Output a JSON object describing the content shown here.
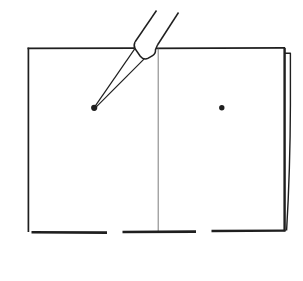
{
  "figure": {
    "colors": {
      "paper": "#ffffff",
      "ink": "#1f1f1f",
      "light_ink": "#6e6e6e"
    },
    "canvas": {
      "width": 303,
      "height": 281
    },
    "elements": [
      {
        "name": "sheet-top-edge-left",
        "type": "line",
        "x1": 27.5,
        "y1": 48.3,
        "x2": 134,
        "y2": 48.1,
        "w": 1.7
      },
      {
        "name": "sheet-top-edge-right",
        "type": "line",
        "x1": 150,
        "y1": 48.3,
        "x2": 285,
        "y2": 47.8,
        "w": 1.7
      },
      {
        "name": "sheet-left-edge",
        "type": "line",
        "x1": 28.4,
        "y1": 47.6,
        "x2": 28.4,
        "y2": 232,
        "w": 1.7
      },
      {
        "name": "sheet-right-edge",
        "type": "line",
        "x1": 284.6,
        "y1": 47.8,
        "x2": 284.6,
        "y2": 231.2,
        "w": 2.4
      },
      {
        "name": "back-sheet-edge",
        "type": "path",
        "d": "M284.5 53.3 L290.4 53.3 L290.4 105 Q290.2 170 286.6 230.5",
        "w": 1.4
      },
      {
        "name": "center-fold-line",
        "type": "line",
        "x1": 158.2,
        "y1": 48.5,
        "x2": 158.2,
        "y2": 231.5,
        "w": 0.9,
        "color": "light"
      },
      {
        "name": "bottom-edge-dash-left",
        "type": "line",
        "x1": 31.5,
        "y1": 232.3,
        "x2": 107,
        "y2": 232.6,
        "w": 2.6
      },
      {
        "name": "bottom-edge-dash-middle",
        "type": "line",
        "x1": 122.5,
        "y1": 232,
        "x2": 196,
        "y2": 231.6,
        "w": 2.6
      },
      {
        "name": "bottom-edge-dash-right",
        "type": "line",
        "x1": 211.5,
        "y1": 231,
        "x2": 285.5,
        "y2": 230.6,
        "w": 2.4
      },
      {
        "name": "stylus-barrel-left-edge",
        "type": "line",
        "x1": 156.5,
        "y1": 10.5,
        "x2": 135,
        "y2": 42,
        "w": 1.5
      },
      {
        "name": "stylus-barrel-right-edge",
        "type": "line",
        "x1": 178.5,
        "y1": 12.5,
        "x2": 157.5,
        "y2": 45,
        "w": 1.5
      },
      {
        "name": "stylus-ferrule",
        "type": "path",
        "d": "M135 42 Q133.3 45.8 135.1 48.8 L140.3 56.2 Q143.8 60.6 148.3 58.2 L152.6 55.6 Q155.8 53.6 155.5 49.5 L157.5 45",
        "w": 1.5,
        "fill": "#ffffff"
      },
      {
        "name": "stylus-tip-upper-edge",
        "type": "line",
        "x1": 134.9,
        "y1": 48.6,
        "x2": 94.3,
        "y2": 107.4,
        "w": 1.2
      },
      {
        "name": "stylus-tip-lower-edge",
        "type": "line",
        "x1": 144.2,
        "y1": 58.8,
        "x2": 95.3,
        "y2": 107.9,
        "w": 1.2
      },
      {
        "name": "left-page-dot",
        "type": "circle",
        "cx": 94.2,
        "cy": 107.8,
        "r": 3.1
      },
      {
        "name": "right-page-dot",
        "type": "circle",
        "cx": 221.8,
        "cy": 107.8,
        "r": 2.7
      }
    ]
  }
}
